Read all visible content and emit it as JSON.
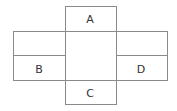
{
  "diagram": {
    "type": "net-of-cuboid",
    "faces": {
      "top": "A",
      "left": "B",
      "bottom": "C",
      "right": "D"
    },
    "line_color": "#8a8a8a",
    "label_color": "#333333"
  }
}
